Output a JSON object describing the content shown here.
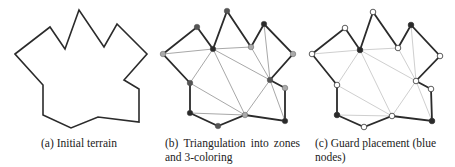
{
  "figure": {
    "panels": [
      {
        "id": "a",
        "caption": "(a) Initial terrain",
        "polygon": [
          [
            15,
            54
          ],
          [
            50,
            27
          ],
          [
            65,
            49
          ],
          [
            79,
            10
          ],
          [
            104,
            47
          ],
          [
            117,
            24
          ],
          [
            147,
            54
          ],
          [
            124,
            80
          ],
          [
            139,
            89
          ],
          [
            139,
            122
          ],
          [
            98,
            117
          ],
          [
            71,
            128
          ],
          [
            43,
            115
          ],
          [
            43,
            85
          ]
        ]
      },
      {
        "id": "b",
        "caption": "(b) Triangulation into zones and 3-coloring",
        "polygon": [
          [
            163,
            54
          ],
          [
            197,
            27
          ],
          [
            213,
            49
          ],
          [
            227,
            11
          ],
          [
            251,
            47
          ],
          [
            264,
            24
          ],
          [
            293,
            54
          ],
          [
            270,
            80
          ],
          [
            285,
            88
          ],
          [
            285,
            121
          ],
          [
            245,
            115
          ],
          [
            218,
            126
          ],
          [
            190,
            113
          ],
          [
            190,
            83
          ]
        ],
        "node_colors": [
          "#aaaaaa",
          "#555555",
          "#2a2a2a",
          "#555555",
          "#aaaaaa",
          "#2a2a2a",
          "#aaaaaa",
          "#555555",
          "#aaaaaa",
          "#2a2a2a",
          "#aaaaaa",
          "#555555",
          "#2a2a2a",
          "#555555"
        ],
        "diagonals": [
          [
            0,
            2
          ],
          [
            2,
            4
          ],
          [
            2,
            13
          ],
          [
            2,
            10
          ],
          [
            2,
            7
          ],
          [
            4,
            7
          ],
          [
            5,
            7
          ],
          [
            13,
            10
          ],
          [
            12,
            10
          ],
          [
            7,
            10
          ],
          [
            7,
            9
          ]
        ]
      },
      {
        "id": "c",
        "caption": "(c) Guard placement (blue nodes)",
        "polygon": [
          [
            312,
            54
          ],
          [
            345,
            28
          ],
          [
            360,
            50
          ],
          [
            373,
            12
          ],
          [
            398,
            48
          ],
          [
            411,
            25
          ],
          [
            440,
            56
          ],
          [
            416,
            81
          ],
          [
            431,
            89
          ],
          [
            432,
            121
          ],
          [
            392,
            116
          ],
          [
            364,
            127
          ],
          [
            337,
            115
          ],
          [
            337,
            85
          ]
        ],
        "guards": [
          2,
          5,
          9,
          12
        ],
        "diagonals": [
          [
            0,
            2
          ],
          [
            2,
            4
          ],
          [
            2,
            13
          ],
          [
            2,
            10
          ],
          [
            2,
            7
          ],
          [
            4,
            7
          ],
          [
            5,
            7
          ],
          [
            13,
            10
          ],
          [
            12,
            10
          ],
          [
            7,
            10
          ],
          [
            7,
            9
          ]
        ]
      }
    ],
    "colors": {
      "edge": "#2b2b2b",
      "diagonal": "#a8a8a8",
      "diagonal_light": "#cfcfcf",
      "guard_node": "#2a2a2a",
      "plain_node_fill": "#ffffff",
      "node_stroke": "#333333"
    }
  }
}
